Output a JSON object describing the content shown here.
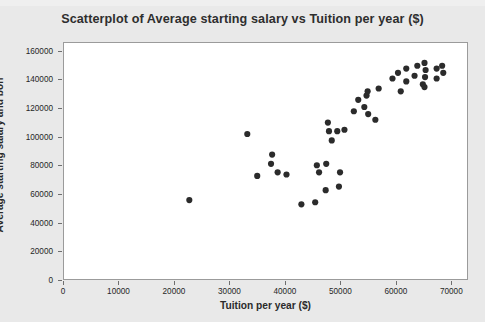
{
  "chart": {
    "title": "Scatterplot of Average starting salary vs Tuition per year ($)",
    "xlabel": "Tuition per year ($)",
    "ylabel": "Average starting salary and bon",
    "marker_color": "#2b2b2b",
    "plot_background": "#ffffff",
    "figure_background": "#e9e9e9"
  },
  "chart_data": {
    "type": "scatter",
    "title": "Scatterplot of Average starting salary vs Tuition per year ($)",
    "xlabel": "Tuition per year ($)",
    "ylabel": "Average starting salary and bon",
    "xlim": [
      0,
      73000
    ],
    "ylim": [
      0,
      166000
    ],
    "xticks": [
      0,
      10000,
      20000,
      30000,
      40000,
      50000,
      60000,
      70000
    ],
    "yticks": [
      0,
      20000,
      40000,
      60000,
      80000,
      100000,
      120000,
      140000,
      160000
    ],
    "xtick_labels": [
      "0",
      "10000",
      "20000",
      "30000",
      "40000",
      "50000",
      "60000",
      "70000"
    ],
    "ytick_labels": [
      "0",
      "20000",
      "40000",
      "60000",
      "80000",
      "100000",
      "120000",
      "140000",
      "160000"
    ],
    "grid": false,
    "legend": false,
    "marker": "filled-circle",
    "marker_color": "#2b2b2b",
    "points": [
      {
        "x": 22700,
        "y": 55500
      },
      {
        "x": 33200,
        "y": 102000
      },
      {
        "x": 35000,
        "y": 72500
      },
      {
        "x": 37700,
        "y": 87500
      },
      {
        "x": 37500,
        "y": 81000
      },
      {
        "x": 38700,
        "y": 75000
      },
      {
        "x": 40300,
        "y": 73500
      },
      {
        "x": 43000,
        "y": 52500
      },
      {
        "x": 45500,
        "y": 54000
      },
      {
        "x": 45800,
        "y": 80000
      },
      {
        "x": 47500,
        "y": 81000
      },
      {
        "x": 47400,
        "y": 62500
      },
      {
        "x": 46200,
        "y": 75000
      },
      {
        "x": 47800,
        "y": 110000
      },
      {
        "x": 48000,
        "y": 104000
      },
      {
        "x": 49500,
        "y": 104000
      },
      {
        "x": 48500,
        "y": 97500
      },
      {
        "x": 50800,
        "y": 105000
      },
      {
        "x": 50000,
        "y": 75000
      },
      {
        "x": 49800,
        "y": 65000
      },
      {
        "x": 52500,
        "y": 118000
      },
      {
        "x": 53300,
        "y": 126000
      },
      {
        "x": 54800,
        "y": 129000
      },
      {
        "x": 54400,
        "y": 121000
      },
      {
        "x": 55100,
        "y": 116000
      },
      {
        "x": 56400,
        "y": 112000
      },
      {
        "x": 55000,
        "y": 132000
      },
      {
        "x": 57000,
        "y": 134000
      },
      {
        "x": 59500,
        "y": 141000
      },
      {
        "x": 62000,
        "y": 139000
      },
      {
        "x": 61000,
        "y": 132000
      },
      {
        "x": 60500,
        "y": 145000
      },
      {
        "x": 62000,
        "y": 148000
      },
      {
        "x": 64000,
        "y": 150000
      },
      {
        "x": 63500,
        "y": 143000
      },
      {
        "x": 65000,
        "y": 137000
      },
      {
        "x": 65300,
        "y": 152000
      },
      {
        "x": 65500,
        "y": 147000
      },
      {
        "x": 65400,
        "y": 142000
      },
      {
        "x": 65300,
        "y": 135000
      },
      {
        "x": 67500,
        "y": 148000
      },
      {
        "x": 67500,
        "y": 141000
      },
      {
        "x": 68500,
        "y": 150000
      },
      {
        "x": 68700,
        "y": 145000
      }
    ]
  }
}
